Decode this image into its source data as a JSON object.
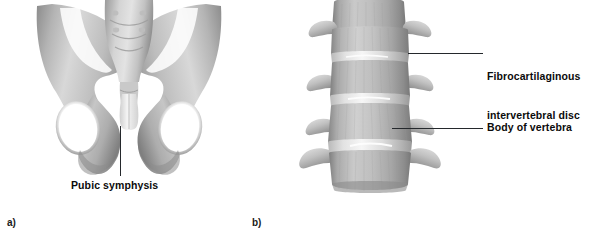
{
  "figure": {
    "panels": [
      {
        "id": "a",
        "caption": "a)",
        "subject": "pelvis-anterior-view",
        "labels": [
          {
            "id": "pubic-symphysis",
            "text": "Pubic symphysis"
          }
        ]
      },
      {
        "id": "b",
        "caption": "b)",
        "subject": "lumbar-vertebral-column-anterior-view",
        "labels": [
          {
            "id": "intervertebral-disc",
            "line1": "Fibrocartilaginous",
            "line2": "intervertebral disc"
          },
          {
            "id": "vertebral-body",
            "line1": "Body of vertebra"
          }
        ]
      }
    ]
  },
  "colors": {
    "background": "#ffffff",
    "text": "#0b0b0b",
    "leader_line": "#24282c",
    "bone_light": "#f1f1f1",
    "bone_mid": "#bdbdbd",
    "bone_dark": "#8e8e8e",
    "bone_shadow": "#6e6e6e"
  }
}
